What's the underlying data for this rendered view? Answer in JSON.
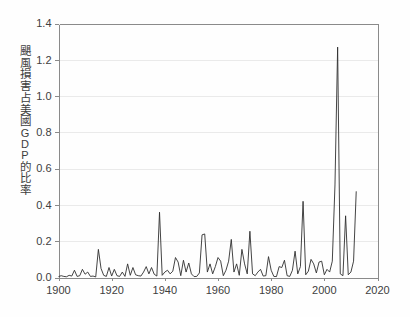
{
  "figure": {
    "background_color": "#fefefe",
    "plot_background_color": "#ffffff",
    "line_color": "#2f2f2f",
    "grid_color": "#eaeaea",
    "axis_color": "#8a8a8a"
  },
  "axis": {
    "ylabel_chars": [
      "颶",
      "風",
      "損",
      "害",
      "占",
      "美",
      "國",
      "G",
      "D",
      "P",
      "的",
      "比",
      "率"
    ],
    "ylabel_text": "颶風損害占美國 GDP 的比率",
    "ytick_labels": [
      "0.0",
      "0.2",
      "0.4",
      "0.6",
      "0.8",
      "1.0",
      "1.2",
      "1.4"
    ],
    "xtick_labels": [
      "1900",
      "1920",
      "1940",
      "1960",
      "1980",
      "2000",
      "2020"
    ]
  },
  "chart_data": {
    "type": "line",
    "title": "",
    "xlabel": "",
    "ylabel": "颶風損害占美國 GDP 的比率",
    "xlim": [
      1900,
      2020
    ],
    "ylim": [
      0.0,
      1.4
    ],
    "xticks": [
      1900,
      1920,
      1940,
      1960,
      1980,
      2000,
      2020
    ],
    "yticks": [
      0.0,
      0.2,
      0.4,
      0.6,
      0.8,
      1.0,
      1.2,
      1.4
    ],
    "grid": "horizontal",
    "legend": null,
    "series": [
      {
        "name": "颶風損害占美國GDP的比率",
        "x": [
          1900,
          1901,
          1902,
          1903,
          1904,
          1905,
          1906,
          1907,
          1908,
          1909,
          1910,
          1911,
          1912,
          1913,
          1914,
          1915,
          1916,
          1917,
          1918,
          1919,
          1920,
          1921,
          1922,
          1923,
          1924,
          1925,
          1926,
          1927,
          1928,
          1929,
          1930,
          1931,
          1932,
          1933,
          1934,
          1935,
          1936,
          1937,
          1938,
          1939,
          1940,
          1941,
          1942,
          1943,
          1944,
          1945,
          1946,
          1947,
          1948,
          1949,
          1950,
          1951,
          1952,
          1953,
          1954,
          1955,
          1956,
          1957,
          1958,
          1959,
          1960,
          1961,
          1962,
          1963,
          1964,
          1965,
          1966,
          1967,
          1968,
          1969,
          1970,
          1971,
          1972,
          1973,
          1974,
          1975,
          1976,
          1977,
          1978,
          1979,
          1980,
          1981,
          1982,
          1983,
          1984,
          1985,
          1986,
          1987,
          1988,
          1989,
          1990,
          1991,
          1992,
          1993,
          1994,
          1995,
          1996,
          1997,
          1998,
          1999,
          2000,
          2001,
          2002,
          2003,
          2004,
          2005,
          2006,
          2007,
          2008,
          2009,
          2010,
          2011,
          2012
        ],
        "values": [
          0.005,
          0.01,
          0.006,
          0.004,
          0.012,
          0.008,
          0.04,
          0.006,
          0.01,
          0.045,
          0.018,
          0.03,
          0.006,
          0.008,
          0.003,
          0.155,
          0.05,
          0.012,
          0.006,
          0.055,
          0.008,
          0.045,
          0.01,
          0.006,
          0.03,
          0.006,
          0.075,
          0.012,
          0.055,
          0.015,
          0.01,
          0.008,
          0.03,
          0.06,
          0.02,
          0.055,
          0.018,
          0.008,
          0.36,
          0.012,
          0.03,
          0.04,
          0.02,
          0.035,
          0.11,
          0.085,
          0.01,
          0.095,
          0.03,
          0.08,
          0.02,
          0.005,
          0.006,
          0.025,
          0.235,
          0.24,
          0.03,
          0.075,
          0.02,
          0.06,
          0.11,
          0.09,
          0.01,
          0.04,
          0.09,
          0.21,
          0.03,
          0.075,
          0.012,
          0.155,
          0.075,
          0.02,
          0.255,
          0.02,
          0.01,
          0.03,
          0.045,
          0.008,
          0.01,
          0.115,
          0.04,
          0.006,
          0.005,
          0.06,
          0.055,
          0.095,
          0.01,
          0.006,
          0.04,
          0.145,
          0.02,
          0.06,
          0.42,
          0.015,
          0.035,
          0.1,
          0.075,
          0.025,
          0.085,
          0.09,
          0.015,
          0.045,
          0.03,
          0.09,
          0.51,
          1.27,
          0.02,
          0.01,
          0.34,
          0.015,
          0.03,
          0.09,
          0.475
        ]
      }
    ]
  }
}
